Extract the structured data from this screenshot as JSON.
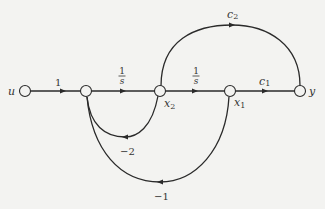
{
  "diagram": {
    "type": "signal-flow-graph",
    "colors": {
      "line": "#2a2a2a",
      "node_fill": "#f3f3f1",
      "text": "#333333",
      "background": "#f3f3f1"
    },
    "nodes": [
      {
        "id": "u",
        "label": "u"
      },
      {
        "id": "n2",
        "label": ""
      },
      {
        "id": "x2",
        "label": "x",
        "sub": "2"
      },
      {
        "id": "x1",
        "label": "x",
        "sub": "1"
      },
      {
        "id": "y",
        "label": "y"
      }
    ],
    "branches": [
      {
        "from": "u",
        "to": "n2",
        "gain": "1"
      },
      {
        "from": "n2",
        "to": "x2",
        "gain_num": "1",
        "gain_den": "s"
      },
      {
        "from": "x2",
        "to": "x1",
        "gain_num": "1",
        "gain_den": "s"
      },
      {
        "from": "x1",
        "to": "y",
        "gain": "c",
        "gain_sub": "1"
      },
      {
        "from": "x2",
        "to": "y",
        "gain": "c",
        "gain_sub": "2"
      },
      {
        "from": "x2",
        "to": "n2",
        "gain": "−2"
      },
      {
        "from": "x1",
        "to": "n2",
        "gain": "−1"
      }
    ]
  }
}
